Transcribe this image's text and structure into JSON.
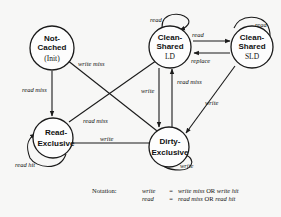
{
  "states": {
    "not_cached": {
      "line1": "Not-",
      "line2": "Cached",
      "sub": "(Init)"
    },
    "clean_shared_ld": {
      "line1": "Clean-",
      "line2": "Shared",
      "sub": "LD"
    },
    "clean_shared_sld": {
      "line1": "Clean-",
      "line2": "Shared",
      "sub": "SLD"
    },
    "read_exclusive": {
      "line1": "Read-",
      "line2": "Exclusive"
    },
    "dirty_exclusive": {
      "line1": "Dirty-",
      "line2": "Exclusive"
    }
  },
  "edges": {
    "nc_to_re": "read miss",
    "nc_to_de": "write miss",
    "re_to_ld": "read miss",
    "re_to_de": "write",
    "re_self": "read hit",
    "ld_self": "read",
    "ld_to_sld": "read",
    "sld_to_ld": "replace",
    "sld_self": "read",
    "ld_to_de": "write",
    "de_to_ld": "read miss",
    "sld_to_de": "write",
    "de_self": "write"
  },
  "notation": {
    "label": "Notation:",
    "rows": [
      {
        "lhs": "write",
        "eq": "=",
        "a": "write miss",
        "or": "OR",
        "b": "write hit"
      },
      {
        "lhs": "read",
        "eq": "=",
        "a": "read miss",
        "or": "OR",
        "b": "read hit"
      }
    ]
  }
}
